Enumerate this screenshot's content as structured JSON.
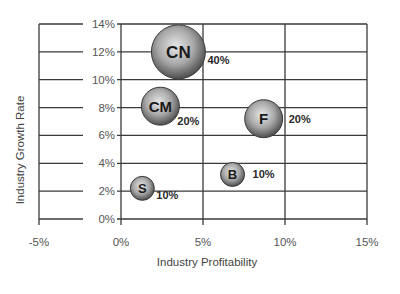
{
  "chart_data": {
    "type": "scatter",
    "subtype": "bubble",
    "title": "",
    "xlabel": "Industry Profitability",
    "ylabel": "Industry Growth Rate",
    "xlim": [
      -5,
      15
    ],
    "ylim": [
      0,
      14
    ],
    "x_ticks": [
      "-5%",
      "0%",
      "5%",
      "10%",
      "15%"
    ],
    "y_ticks": [
      "0%",
      "2%",
      "4%",
      "6%",
      "8%",
      "10%",
      "12%",
      "14%"
    ],
    "grid": true,
    "legend": null,
    "points": [
      {
        "label": "CN",
        "x": 3.5,
        "y": 12.0,
        "size_label": "40%",
        "size": 40
      },
      {
        "label": "CM",
        "x": 2.4,
        "y": 8.1,
        "size_label": "20%",
        "size": 20
      },
      {
        "label": "F",
        "x": 8.7,
        "y": 7.2,
        "size_label": "20%",
        "size": 20
      },
      {
        "label": "B",
        "x": 6.8,
        "y": 3.2,
        "size_label": "10%",
        "size": 10
      },
      {
        "label": "S",
        "x": 1.3,
        "y": 2.2,
        "size_label": "10%",
        "size": 10
      }
    ]
  },
  "colors": {
    "grid": "#3a3a3a",
    "bubble_light": "#e6e6e6",
    "bubble_dark": "#5a5a5a",
    "text": "#1a1a1a"
  }
}
